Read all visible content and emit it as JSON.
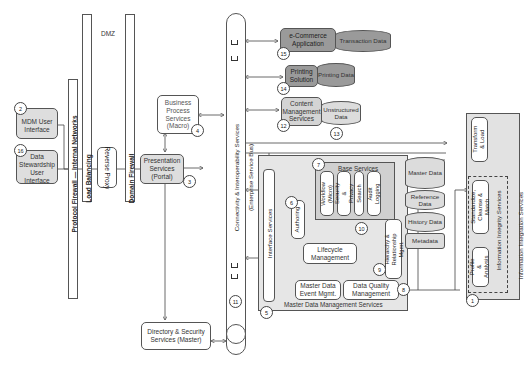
{
  "diagram": {
    "zones": {
      "dmz_label": "DMZ",
      "protocol_firewall": "Protocol Firewall — Internal Networks",
      "load_balancing": "Load Balancing",
      "domain_firewall": "Domain Firewall"
    },
    "ui_nodes": [
      {
        "num": "2",
        "label": "MDM User Interface"
      },
      {
        "num": "16",
        "label": "Data Stewardship User Interface"
      }
    ],
    "reverse_proxy": "Reverse Proxy",
    "business_process": {
      "num": "4",
      "label": "Business Process Services (Macro)"
    },
    "presentation": {
      "num": "3",
      "label": "Presentation Services (Portal)"
    },
    "directory": {
      "label": "Directory & Security Services (Master)"
    },
    "esb": {
      "num": "11",
      "label": "Connectivity & Interoperability Services",
      "sublabel": "(Enterprise Service Bus)"
    },
    "external_apps": [
      {
        "num": "15",
        "label": "e-Commerce Application",
        "data": "Transaction Data"
      },
      {
        "num": "14",
        "label": "Printing Solution",
        "data": "Printing Data"
      },
      {
        "num": "12",
        "label": "Content Management Services",
        "data": "Unstructured Data"
      }
    ],
    "etl_flow_num": "13",
    "mdm": {
      "title": "Master Data Management Services",
      "num": "5",
      "interface_services": "Interface Services",
      "base_services": {
        "num": "7",
        "title": "Base Services",
        "items": [
          "Workflow (Micro)",
          "Security & Privacy",
          "Search",
          "Audit Logging"
        ],
        "bus_num": "10"
      },
      "authoring": {
        "num": "6",
        "label": "Authoring"
      },
      "lifecycle": "Lifecycle Management",
      "hierarchy": {
        "num": "9",
        "label": "Hierarchy & Relationship Mgmt."
      },
      "event_mgmt": "Master Data Event Mgmt.",
      "data_quality": {
        "num": "8",
        "label": "Data Quality Management"
      },
      "stores": [
        "Master Data",
        "Reference Data",
        "History Data",
        "Metadata"
      ]
    },
    "integration": {
      "num": "1",
      "title": "Information Integration Services",
      "transform": "Transform & Load",
      "integrity_title": "Information Integrity Services",
      "standardize": "Standardize, Cleanse & Match",
      "profile": "Profile & Analysis"
    }
  }
}
